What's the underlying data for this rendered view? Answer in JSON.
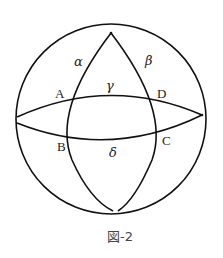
{
  "figure": {
    "caption": "図-2",
    "points": {
      "A": "A",
      "B": "B",
      "C": "C",
      "D": "D"
    },
    "regions": {
      "alpha": "α",
      "beta": "β",
      "gamma": "γ",
      "delta": "δ"
    },
    "colors": {
      "stroke": "#111111",
      "background": "#ffffff"
    }
  }
}
